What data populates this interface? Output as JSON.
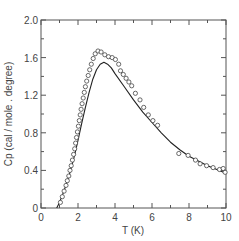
{
  "chart_data": {
    "type": "scatter",
    "title": "",
    "xlabel": "T (K)",
    "ylabel": "Cp (cal / mole . degree)",
    "xlim": [
      0,
      10
    ],
    "ylim": [
      0,
      2.0
    ],
    "grid": false,
    "legend": null,
    "x_ticks": [
      0,
      2,
      4,
      6,
      8,
      10
    ],
    "x_tick_labels": [
      "0",
      "2",
      "4",
      "6",
      "8",
      "10"
    ],
    "x_minor_ticks": [
      1,
      3,
      5,
      7,
      9
    ],
    "y_ticks": [
      0,
      0.4,
      0.8,
      1.2,
      1.6,
      2.0
    ],
    "y_tick_labels": [
      "0",
      "0.4",
      "0.8",
      "1.2",
      "1.6",
      "2.0"
    ],
    "y_minor_ticks": [
      0.2,
      0.6,
      1.0,
      1.4,
      1.8
    ],
    "series": [
      {
        "name": "measured",
        "style": "open-circle",
        "points": [
          [
            1.05,
            0.06
          ],
          [
            1.15,
            0.12
          ],
          [
            1.25,
            0.18
          ],
          [
            1.35,
            0.24
          ],
          [
            1.42,
            0.29
          ],
          [
            1.5,
            0.34
          ],
          [
            1.57,
            0.4
          ],
          [
            1.63,
            0.45
          ],
          [
            1.7,
            0.51
          ],
          [
            1.76,
            0.57
          ],
          [
            1.82,
            0.63
          ],
          [
            1.87,
            0.69
          ],
          [
            1.92,
            0.75
          ],
          [
            1.97,
            0.81
          ],
          [
            2.02,
            0.87
          ],
          [
            2.07,
            0.93
          ],
          [
            2.12,
            0.99
          ],
          [
            2.17,
            1.05
          ],
          [
            2.22,
            1.11
          ],
          [
            2.28,
            1.17
          ],
          [
            2.34,
            1.23
          ],
          [
            2.4,
            1.29
          ],
          [
            2.47,
            1.35
          ],
          [
            2.55,
            1.41
          ],
          [
            2.63,
            1.47
          ],
          [
            2.72,
            1.53
          ],
          [
            2.82,
            1.59
          ],
          [
            2.93,
            1.64
          ],
          [
            3.08,
            1.67
          ],
          [
            3.25,
            1.66
          ],
          [
            3.45,
            1.63
          ],
          [
            3.65,
            1.61
          ],
          [
            3.85,
            1.6
          ],
          [
            4.02,
            1.58
          ],
          [
            4.2,
            1.53
          ],
          [
            4.3,
            1.46
          ],
          [
            4.45,
            1.42
          ],
          [
            4.6,
            1.38
          ],
          [
            4.75,
            1.34
          ],
          [
            4.9,
            1.3
          ],
          [
            5.1,
            1.22
          ],
          [
            5.35,
            1.15
          ],
          [
            5.55,
            1.07
          ],
          [
            5.8,
            0.99
          ],
          [
            6.05,
            0.93
          ],
          [
            6.3,
            0.88
          ],
          [
            7.45,
            0.58
          ],
          [
            7.95,
            0.56
          ],
          [
            8.35,
            0.51
          ],
          [
            8.6,
            0.47
          ],
          [
            8.95,
            0.45
          ],
          [
            9.3,
            0.43
          ],
          [
            9.65,
            0.41
          ],
          [
            9.85,
            0.42
          ],
          [
            9.95,
            0.38
          ]
        ]
      },
      {
        "name": "theory",
        "style": "solid-line",
        "points": [
          [
            0.85,
            0.0
          ],
          [
            1.0,
            0.06
          ],
          [
            1.2,
            0.16
          ],
          [
            1.4,
            0.27
          ],
          [
            1.6,
            0.4
          ],
          [
            1.8,
            0.55
          ],
          [
            2.0,
            0.72
          ],
          [
            2.2,
            0.9
          ],
          [
            2.4,
            1.07
          ],
          [
            2.6,
            1.23
          ],
          [
            2.8,
            1.37
          ],
          [
            3.0,
            1.47
          ],
          [
            3.2,
            1.53
          ],
          [
            3.4,
            1.55
          ],
          [
            3.6,
            1.53
          ],
          [
            3.8,
            1.49
          ],
          [
            4.0,
            1.43
          ],
          [
            4.5,
            1.29
          ],
          [
            5.0,
            1.15
          ],
          [
            5.5,
            1.02
          ],
          [
            6.0,
            0.91
          ],
          [
            6.5,
            0.8
          ],
          [
            7.0,
            0.7
          ],
          [
            7.5,
            0.62
          ],
          [
            8.0,
            0.55
          ],
          [
            8.5,
            0.5
          ],
          [
            9.0,
            0.45
          ],
          [
            9.5,
            0.41
          ],
          [
            10.0,
            0.37
          ]
        ]
      }
    ]
  },
  "colors": {
    "axis": "#555555",
    "marker": "#444444",
    "line": "#222222",
    "background": "#ffffff"
  }
}
